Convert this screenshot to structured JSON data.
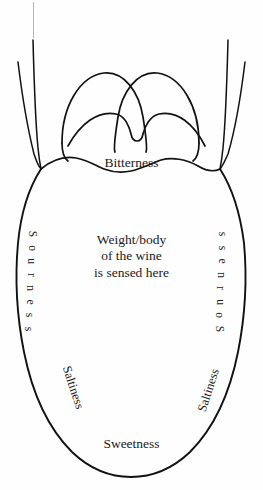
{
  "diagram": {
    "stroke_color": "#111111",
    "background_color": "#ffffff",
    "text_color": "#1b1b1b"
  },
  "labels": {
    "bitterness": "Bitterness",
    "sweetness": "Sweetness",
    "sourness": "Sourness",
    "saltiness": "Saltiness",
    "sourness_letters": [
      "S",
      "o",
      "u",
      "r",
      "n",
      "e",
      "s",
      "s"
    ],
    "center": {
      "line1": "Weight/body",
      "line2": "of the wine",
      "line3": "is sensed here"
    }
  }
}
